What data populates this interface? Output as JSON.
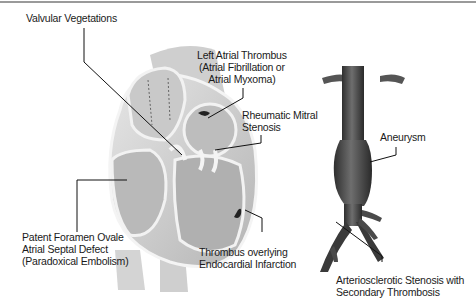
{
  "diagram": {
    "labels": {
      "valvular_vegetations": [
        "Valvular Vegetations"
      ],
      "left_atrial_thrombus": [
        "Left Atrial Thrombus",
        "(Atrial Fibrillation or",
        "Atrial Myxoma)"
      ],
      "rheumatic_mitral_stenosis": [
        "Rheumatic Mitral",
        "Stenosis"
      ],
      "patent_foramen_ovale": [
        "Patent Foramen Ovale",
        "Atrial Septal Defect",
        "(Paradoxical Embolism)"
      ],
      "thrombus_endocardial": [
        "Thrombus overlying",
        "Endocardial Infarction"
      ],
      "aneurysm": [
        "Aneurysm"
      ],
      "arteriosclerotic_stenosis": [
        "Arteriosclerotic Stenosis with",
        "Secondary Thrombosis"
      ]
    },
    "figures": [
      "heart-cross-section",
      "abdominal-aorta"
    ],
    "colors": {
      "background": "#ffffff",
      "border": "#9a9a9a",
      "heart_light": "#d8d8d8",
      "heart_dark": "#a8a8a8",
      "aorta": "#4a4a4a",
      "leader_line": "#111111"
    }
  }
}
